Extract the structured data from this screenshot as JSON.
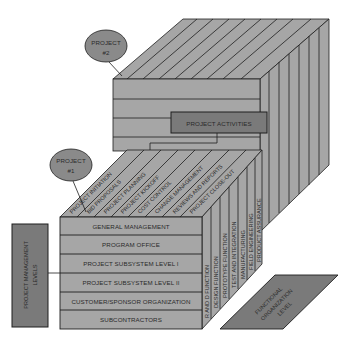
{
  "diagram": {
    "type": "3d-matrix-cube",
    "projects": [
      {
        "label_line1": "PROJECT",
        "label_line2": "#2"
      },
      {
        "label_line1": "PROJECT",
        "label_line2": "#1"
      }
    ],
    "project_activities_label": "PROJECT ACTIVITIES",
    "activities": [
      "PROJECT INITIATION",
      "BID PROPOSALS",
      "PROJECT PLANNING",
      "PROJECT KICKOFF",
      "COST CONTROL",
      "CHANGE MANAGEMENT",
      "REVIEWS AND REPORTS",
      "PROJECT CLOSE-OUT"
    ],
    "management_levels": [
      "GENERAL MANAGEMENT",
      "PROGRAM OFFICE",
      "PROJECT SUBSYSTEM  LEVEL I",
      "PROJECT SUBSYSTEM  LEVEL II",
      "CUSTOMER/SPONSOR ORGANIZATION",
      "SUBCONTRACTORS"
    ],
    "functions": [
      "R AND D FUNCTION",
      "DESIGN FUNCTION",
      "PROTOTYPE FUNCTION",
      "TEST AND INTEGRATION",
      "MANUFACTURING",
      "FIELD ENGINEERING",
      "PRODUCT ASSURANCE"
    ],
    "pm_levels_label": {
      "line1": "PROJECT MANAGEMENT",
      "line2": "LEVELS"
    },
    "functional_label": {
      "line1": "FUNCTIONAL",
      "line2": "ORGANIZATION",
      "line3": "LEVEL"
    },
    "colors": {
      "face": "#a6a6a6",
      "face_dark": "#8c8c8c",
      "label_box": "#7a7a7a",
      "ellipse": "#8a8a8a",
      "line": "#1e1e1e"
    }
  }
}
